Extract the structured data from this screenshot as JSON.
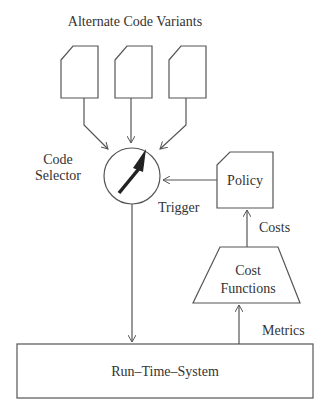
{
  "title": "Alternate Code Variants",
  "code_selector": {
    "line1": "Code",
    "line2": "Selector"
  },
  "policy": "Policy",
  "trigger": "Trigger",
  "costs": "Costs",
  "cost_functions": {
    "line1": "Cost",
    "line2": "Functions"
  },
  "metrics": "Metrics",
  "runtime": "Run–Time–System",
  "colors": {
    "stroke": "#555555",
    "text": "#333333",
    "needle": "#222222"
  }
}
